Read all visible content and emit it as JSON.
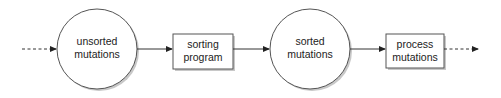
{
  "diagram": {
    "type": "flowchart",
    "direction": "left-to-right",
    "nodes": [
      {
        "id": "unsorted",
        "shape": "circle",
        "label_lines": [
          "unsorted",
          "mutations"
        ]
      },
      {
        "id": "sorting",
        "shape": "rectangle",
        "label_lines": [
          "sorting",
          "program"
        ]
      },
      {
        "id": "sorted",
        "shape": "circle",
        "label_lines": [
          "sorted",
          "mutations"
        ]
      },
      {
        "id": "process",
        "shape": "rectangle",
        "label_lines": [
          "process",
          "mutations"
        ]
      }
    ],
    "edges": [
      {
        "from": "input",
        "to": "unsorted",
        "style": "dashed"
      },
      {
        "from": "unsorted",
        "to": "sorting",
        "style": "solid"
      },
      {
        "from": "sorting",
        "to": "sorted",
        "style": "solid"
      },
      {
        "from": "sorted",
        "to": "process",
        "style": "solid"
      },
      {
        "from": "process",
        "to": "output",
        "style": "dashed"
      }
    ],
    "colors": {
      "stroke": "#555555",
      "fill": "#ffffff",
      "text": "#222222",
      "shadow": "#9a9a9a"
    }
  }
}
